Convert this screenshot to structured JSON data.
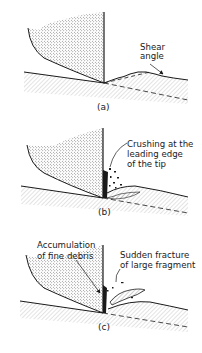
{
  "figure": {
    "panels": [
      {
        "id": "a",
        "caption": "(a)",
        "labels": [
          "Shear",
          "angle"
        ]
      },
      {
        "id": "b",
        "caption": "(b)",
        "labels": [
          "Crushing at the",
          "leading edge",
          "of the tip"
        ]
      },
      {
        "id": "c",
        "caption": "(c)",
        "labels_left": [
          "Accumulation",
          "of fine debris"
        ],
        "labels_right": [
          "Sudden fracture",
          "of large fragment"
        ]
      }
    ],
    "colors": {
      "ink": "#1a1a1a",
      "stipple": "#555555",
      "background": "#ffffff"
    }
  }
}
